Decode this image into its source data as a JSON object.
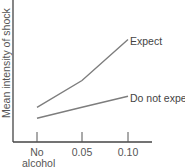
{
  "chart_data": {
    "type": "line",
    "title": "",
    "xlabel": "",
    "ylabel": "Mean intensity of shock",
    "categories": [
      "No alcohol",
      "0.05",
      "0.10"
    ],
    "category_lines": [
      [
        "No",
        "alcohol"
      ],
      [
        "0.05"
      ],
      [
        "0.10"
      ]
    ],
    "series": [
      {
        "name": "Expect",
        "values": [
          2.2,
          3.9,
          6.5
        ]
      },
      {
        "name": "Do not expect",
        "values": [
          1.5,
          2.2,
          2.9
        ]
      }
    ],
    "ylim": [
      0,
      9
    ],
    "grid": false,
    "legend_position": "inline-right",
    "line_color": "#7d7d7d",
    "axis_color": "#444444"
  }
}
